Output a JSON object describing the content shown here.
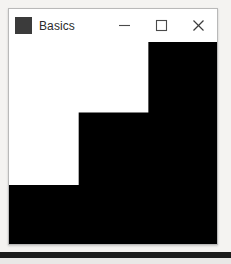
{
  "window": {
    "title": "Basics",
    "app_icon": "app-square-icon",
    "icon_color": "#3b3b3b",
    "titlebar_background": "#ffffff",
    "border_color": "#b9b9b9",
    "controls": [
      {
        "name": "minimize",
        "label": "—",
        "icon": "minimize-icon"
      },
      {
        "name": "maximize",
        "label": "□",
        "icon": "maximize-icon"
      },
      {
        "name": "close",
        "label": "✕",
        "icon": "close-icon"
      }
    ]
  },
  "desktop": {
    "background": "#f4f3f1",
    "band_color": "#1b1b1b"
  },
  "canvas": {
    "background": "#ffffff",
    "shape_color": "#000000",
    "shape_name": "staircase",
    "viewbox": "0 0 200 195",
    "path": "M 0 138 L 67 138 L 67 68 L 134 68 L 134 0 L 200 0 L 200 195 L 0 195 Z",
    "steps": [
      {
        "index": 1,
        "x": 0,
        "y": 138,
        "width": 200,
        "height": 57
      },
      {
        "index": 2,
        "x": 67,
        "y": 68,
        "width": 133,
        "height": 70
      },
      {
        "index": 3,
        "x": 134,
        "y": 0,
        "width": 66,
        "height": 68
      }
    ]
  }
}
